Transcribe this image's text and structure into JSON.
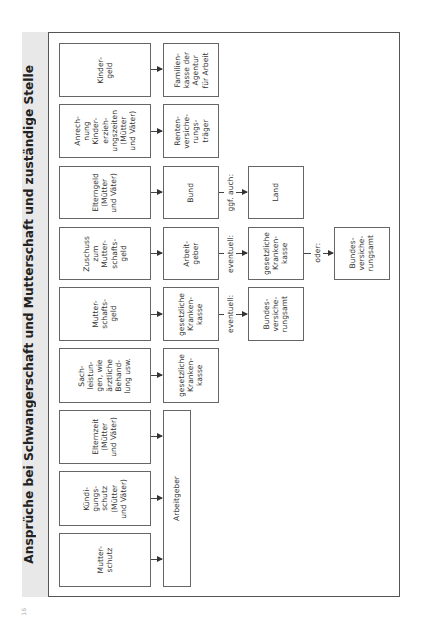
{
  "diagram": {
    "title": "Ansprüche bei Schwangerschaft und Mutterschaft und zuständige Stelle",
    "page_number": "16",
    "rows": [
      {
        "id": "kindergeld",
        "claim": "Kinder-\ngeld",
        "authority": "Familien-\nkasse der\nAgentur\nfür Arbeit"
      },
      {
        "id": "anrechnung",
        "claim": "Anrech-\nnung\nKinder-\nerzieh-\nungszeiten\n(Mütter\nund Väter)",
        "authority": "Renten-\nversiche-\nrungs-\nträger"
      },
      {
        "id": "elterngeld",
        "claim": "Elterngeld\n(Mütter\nund Väter)",
        "authority": "Bund",
        "next": {
          "label": "ggf. auch:",
          "target": "Land"
        }
      },
      {
        "id": "zuschuss",
        "claim": "Zuschuss\nzum\nMutter-\nschafts-\ngeld",
        "authority": "Arbeit-\ngeber",
        "next": {
          "label": "eventuell:",
          "target": "gesetzliche\nKranken-\nkasse",
          "next": {
            "label": "oder:",
            "target": "Bundes-\nversiche-\nrungsamt"
          }
        }
      },
      {
        "id": "mutterschaftsgeld",
        "claim": "Mutter-\nschafts-\ngeld",
        "authority": "gesetzliche\nKranken-\nkasse",
        "next": {
          "label": "eventuell:",
          "target": "Bundes-\nversiche-\nrungsamt"
        }
      },
      {
        "id": "sachleistungen",
        "claim": "Sach-\nleistun-\ngen, wie\närztliche\nBehand-\nlung usw.",
        "authority": "gesetzliche\nKranken-\nkasse"
      },
      {
        "id": "elternzeit",
        "claim": "Elternzeit\n(Mütter\nund Väter)",
        "authority_shared": "Arbeitgeber"
      },
      {
        "id": "kuendigungsschutz",
        "claim": "Kündi-\ngungs-\nschutz\n(Mütter\nund Väter)",
        "authority_shared": "Arbeitgeber"
      },
      {
        "id": "mutterschutz",
        "claim": "Mutter-\nschutz",
        "authority_shared": "Arbeitgeber"
      }
    ],
    "shared_authority": "Arbeitgeber",
    "colors": {
      "title_strip": "#e8e8e8",
      "border": "#555555",
      "text": "#333333"
    }
  }
}
